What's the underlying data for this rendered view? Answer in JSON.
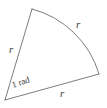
{
  "figure": {
    "name": "circular-sector-one-radian",
    "background_color": "#ffffff",
    "stroke_color": "#6e6e6e",
    "label_color": "#3b3b3b",
    "stroke_width": 0.9,
    "geometry": {
      "center": {
        "x": 5,
        "y": 100
      },
      "radius": 95,
      "arc_start": {
        "x": 32,
        "y": 9
      },
      "arc_end": {
        "x": 99,
        "y": 74
      },
      "angle_radians": 1,
      "arc_path": "M 32 9 A 95 95 0 0 1 99 74"
    },
    "labels": {
      "left_radius": {
        "text": "r",
        "x": 9,
        "y": 53,
        "rotation": 0,
        "font_size": 11
      },
      "arc": {
        "text": "r",
        "x": 76,
        "y": 28,
        "rotation": 0,
        "font_size": 11
      },
      "bottom_radius": {
        "text": "r",
        "x": 60,
        "y": 97,
        "rotation": 0,
        "font_size": 11
      },
      "angle": {
        "text": "1 rad",
        "x": 13,
        "y": 88,
        "rotation": -19,
        "font_size": 9
      }
    }
  }
}
